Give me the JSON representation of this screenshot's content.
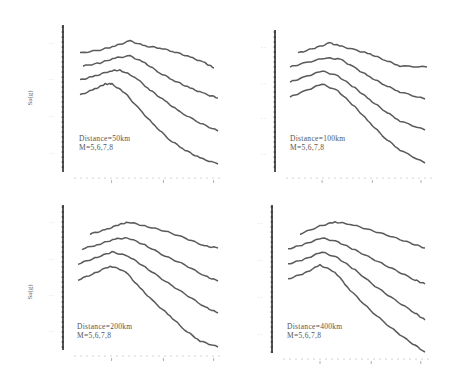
{
  "chart_data": [
    {
      "type": "line",
      "title": "",
      "xlabel": "",
      "ylabel": "Sa(g)",
      "xscale": "log",
      "yscale": "log",
      "legend": [
        "Distance=50km",
        "M=5,6,7,8"
      ],
      "grid": false,
      "series": [
        {
          "name": "M=8",
          "points": [
            [
              80,
              53
            ],
            [
              100,
              50
            ],
            [
              115,
              46
            ],
            [
              130,
              41
            ],
            [
              145,
              46
            ],
            [
              160,
              48
            ],
            [
              175,
              52
            ],
            [
              190,
              57
            ],
            [
              205,
              63
            ],
            [
              214,
              68
            ]
          ]
        },
        {
          "name": "M=7",
          "points": [
            [
              83,
              66
            ],
            [
              100,
              63
            ],
            [
              115,
              58
            ],
            [
              130,
              56
            ],
            [
              145,
              63
            ],
            [
              160,
              73
            ],
            [
              175,
              81
            ],
            [
              190,
              88
            ],
            [
              205,
              94
            ],
            [
              218,
              98
            ]
          ]
        },
        {
          "name": "M=6",
          "points": [
            [
              80,
              80
            ],
            [
              95,
              76
            ],
            [
              110,
              71
            ],
            [
              120,
              70
            ],
            [
              135,
              77
            ],
            [
              150,
              90
            ],
            [
              165,
              101
            ],
            [
              180,
              112
            ],
            [
              200,
              123
            ],
            [
              218,
              131
            ]
          ]
        },
        {
          "name": "M=5",
          "points": [
            [
              80,
              95
            ],
            [
              95,
              89
            ],
            [
              105,
              84
            ],
            [
              112,
              84
            ],
            [
              125,
              93
            ],
            [
              140,
              110
            ],
            [
              155,
              126
            ],
            [
              170,
              140
            ],
            [
              185,
              150
            ],
            [
              200,
              158
            ],
            [
              218,
              164
            ]
          ]
        }
      ]
    },
    {
      "type": "line",
      "title": "",
      "xlabel": "",
      "ylabel": "",
      "xscale": "log",
      "yscale": "log",
      "legend": [
        "Distance=100km",
        "M=5,6,7,8"
      ],
      "grid": false,
      "series": [
        {
          "name": "M=8",
          "points": [
            [
              298,
              53
            ],
            [
              315,
              48
            ],
            [
              330,
              43
            ],
            [
              340,
              46
            ],
            [
              355,
              50
            ],
            [
              370,
              54
            ],
            [
              385,
              60
            ],
            [
              400,
              66
            ],
            [
              427,
              67
            ]
          ]
        },
        {
          "name": "M=7",
          "points": [
            [
              290,
              67
            ],
            [
              305,
              63
            ],
            [
              325,
              58
            ],
            [
              340,
              59
            ],
            [
              355,
              68
            ],
            [
              370,
              77
            ],
            [
              385,
              85
            ],
            [
              400,
              92
            ],
            [
              425,
              99
            ]
          ]
        },
        {
          "name": "M=6",
          "points": [
            [
              290,
              82
            ],
            [
              305,
              77
            ],
            [
              322,
              71
            ],
            [
              338,
              76
            ],
            [
              355,
              88
            ],
            [
              370,
              100
            ],
            [
              385,
              111
            ],
            [
              400,
              121
            ],
            [
              425,
              130
            ]
          ]
        },
        {
          "name": "M=5",
          "points": [
            [
              290,
              97
            ],
            [
              305,
              91
            ],
            [
              322,
              84
            ],
            [
              338,
              91
            ],
            [
              355,
              107
            ],
            [
              370,
              123
            ],
            [
              385,
              138
            ],
            [
              400,
              150
            ],
            [
              425,
              163
            ]
          ]
        }
      ]
    },
    {
      "type": "line",
      "title": "",
      "xlabel": "",
      "ylabel": "Sa(g)",
      "xscale": "log",
      "yscale": "log",
      "legend": [
        "Distance=200km",
        "M=5,6,7,8"
      ],
      "grid": false,
      "series": [
        {
          "name": "M=8",
          "points": [
            [
              90,
              234
            ],
            [
              105,
              230
            ],
            [
              118,
              225
            ],
            [
              128,
              222
            ],
            [
              145,
              226
            ],
            [
              165,
              231
            ],
            [
              185,
              238
            ],
            [
              205,
              246
            ],
            [
              218,
              248
            ]
          ]
        },
        {
          "name": "M=7",
          "points": [
            [
              82,
              249
            ],
            [
              100,
              244
            ],
            [
              115,
              239
            ],
            [
              128,
              238
            ],
            [
              145,
              245
            ],
            [
              165,
              256
            ],
            [
              185,
              265
            ],
            [
              205,
              276
            ],
            [
              218,
              281
            ]
          ]
        },
        {
          "name": "M=6",
          "points": [
            [
              78,
              264
            ],
            [
              95,
              258
            ],
            [
              112,
              252
            ],
            [
              128,
              256
            ],
            [
              145,
              267
            ],
            [
              165,
              281
            ],
            [
              185,
              294
            ],
            [
              205,
              307
            ],
            [
              218,
              313
            ]
          ]
        },
        {
          "name": "M=5",
          "points": [
            [
              78,
              280
            ],
            [
              95,
              273
            ],
            [
              110,
              266
            ],
            [
              125,
              271
            ],
            [
              140,
              288
            ],
            [
              155,
              303
            ],
            [
              170,
              316
            ],
            [
              185,
              330
            ],
            [
              200,
              341
            ],
            [
              218,
              347
            ]
          ]
        }
      ]
    },
    {
      "type": "line",
      "title": "",
      "xlabel": "",
      "ylabel": "",
      "xscale": "log",
      "yscale": "log",
      "legend": [
        "Distance=400km",
        "M=5,6,7,8"
      ],
      "grid": false,
      "series": [
        {
          "name": "M=8",
          "points": [
            [
              300,
              234
            ],
            [
              320,
              226
            ],
            [
              335,
              222
            ],
            [
              350,
              224
            ],
            [
              370,
              230
            ],
            [
              390,
              236
            ],
            [
              410,
              243
            ],
            [
              425,
              248
            ]
          ]
        },
        {
          "name": "M=7",
          "points": [
            [
              288,
              249
            ],
            [
              305,
              244
            ],
            [
              322,
              238
            ],
            [
              338,
              242
            ],
            [
              355,
              250
            ],
            [
              375,
              260
            ],
            [
              395,
              270
            ],
            [
              415,
              280
            ],
            [
              425,
              284
            ]
          ]
        },
        {
          "name": "M=6",
          "points": [
            [
              288,
              264
            ],
            [
              305,
              259
            ],
            [
              322,
              252
            ],
            [
              338,
              258
            ],
            [
              355,
              270
            ],
            [
              375,
              286
            ],
            [
              395,
              300
            ],
            [
              415,
              313
            ],
            [
              425,
              320
            ]
          ]
        },
        {
          "name": "M=5",
          "points": [
            [
              288,
              279
            ],
            [
              305,
              273
            ],
            [
              320,
              265
            ],
            [
              335,
              272
            ],
            [
              350,
              290
            ],
            [
              370,
              310
            ],
            [
              390,
              327
            ],
            [
              410,
              342
            ],
            [
              425,
              352
            ]
          ]
        }
      ]
    }
  ],
  "panels": [
    {
      "legend_line1": "Distance=50km",
      "legend_line2": "M=5,6,7,8",
      "ylabel": "Sa(g)"
    },
    {
      "legend_line1": "Distance=100km",
      "legend_line2": "M=5,6,7,8",
      "ylabel": ""
    },
    {
      "legend_line1": "Distance=200km",
      "legend_line2": "M=5,6,7,8",
      "ylabel": "Sa(g)"
    },
    {
      "legend_line1": "Distance=400km",
      "legend_line2": "M=5,6,7,8",
      "ylabel": ""
    }
  ],
  "colors": {
    "curve": "#5a5a5a",
    "axis": "#2a2a2a",
    "tick": "#9a9a9a"
  }
}
